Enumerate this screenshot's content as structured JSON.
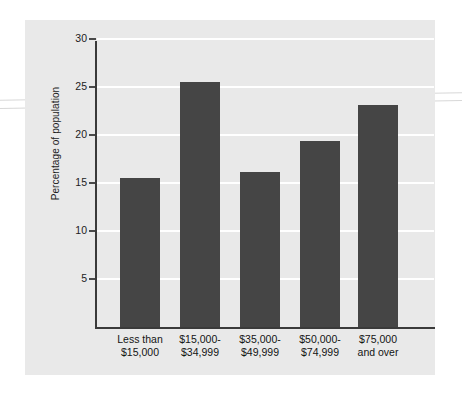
{
  "chart_data": {
    "type": "bar",
    "title": "",
    "xlabel": "",
    "ylabel": "Percentage of population",
    "ylim": [
      0,
      31
    ],
    "yticks": [
      5,
      10,
      15,
      20,
      25,
      30
    ],
    "ytick_labels": [
      "5",
      "10",
      "15",
      "20",
      "25",
      "30"
    ],
    "grid": true,
    "legend": "none",
    "bar_color": "#454545",
    "plot_background": "#e9e9e9",
    "gridline_color": "#ffffff",
    "axis_color": "#3a3a3a",
    "categories": [
      "Less than $15,000",
      "$15,000-$34,999",
      "$35,000-$49,999",
      "$50,000-$74,999",
      "$75,000 and over"
    ],
    "category_lines": [
      [
        "Less than",
        "$15,000"
      ],
      [
        "$15,000-",
        "$34,999"
      ],
      [
        "$35,000-",
        "$49,999"
      ],
      [
        "$50,000-",
        "$74,999"
      ],
      [
        "$75,000",
        "and over"
      ]
    ],
    "values": [
      15.5,
      25.5,
      16.1,
      19.4,
      23.1
    ]
  }
}
